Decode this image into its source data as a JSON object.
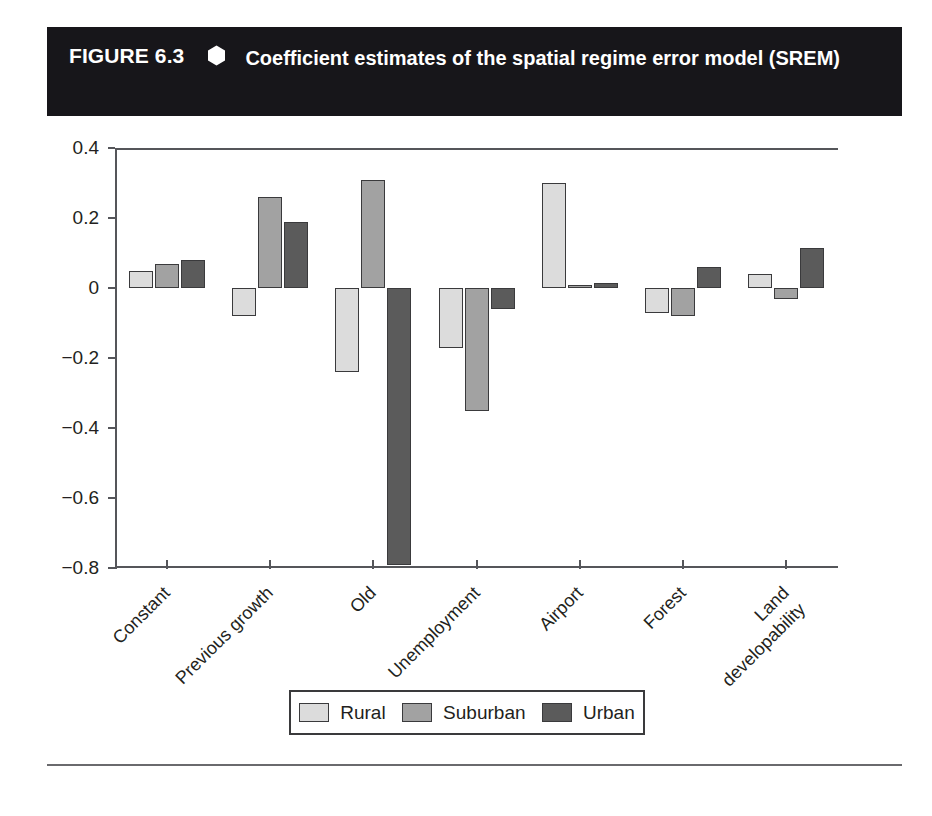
{
  "figure": {
    "label": "FIGURE 6.3",
    "marker_icon": "hexagon-bullet-icon",
    "title": "Coefficient estimates of the spatial regime error model (SREM)"
  },
  "legend": {
    "position": "bottom-center",
    "items": [
      {
        "label": "Rural",
        "color": "#dcdcdc"
      },
      {
        "label": "Suburban",
        "color": "#a2a2a2"
      },
      {
        "label": "Urban",
        "color": "#5b5b5b"
      }
    ]
  },
  "chart_data": {
    "type": "bar",
    "title": "Coefficient estimates of the spatial regime error model (SREM)",
    "xlabel": "",
    "ylabel": "",
    "ylim": [
      -0.8,
      0.4
    ],
    "yticks": [
      "0.4",
      "0.2",
      "0",
      "−0.2",
      "−0.4",
      "−0.6",
      "−0.8"
    ],
    "ytick_values": [
      0.4,
      0.2,
      0,
      -0.2,
      -0.4,
      -0.6,
      -0.8
    ],
    "grid": false,
    "zero_line": true,
    "categories": [
      "Constant",
      "Previous growth",
      "Old",
      "Unemployment",
      "Airport",
      "Forest",
      "Land\ndevelopability"
    ],
    "series": [
      {
        "name": "Rural",
        "color": "#dcdcdc",
        "values": [
          0.05,
          -0.08,
          -0.24,
          -0.17,
          0.3,
          -0.07,
          0.04
        ]
      },
      {
        "name": "Suburban",
        "color": "#a2a2a2",
        "values": [
          0.07,
          0.26,
          0.31,
          -0.35,
          0.01,
          -0.08,
          -0.03
        ]
      },
      {
        "name": "Urban",
        "color": "#5b5b5b",
        "values": [
          0.08,
          0.19,
          -0.79,
          -0.06,
          0.015,
          0.06,
          0.115
        ]
      }
    ]
  }
}
